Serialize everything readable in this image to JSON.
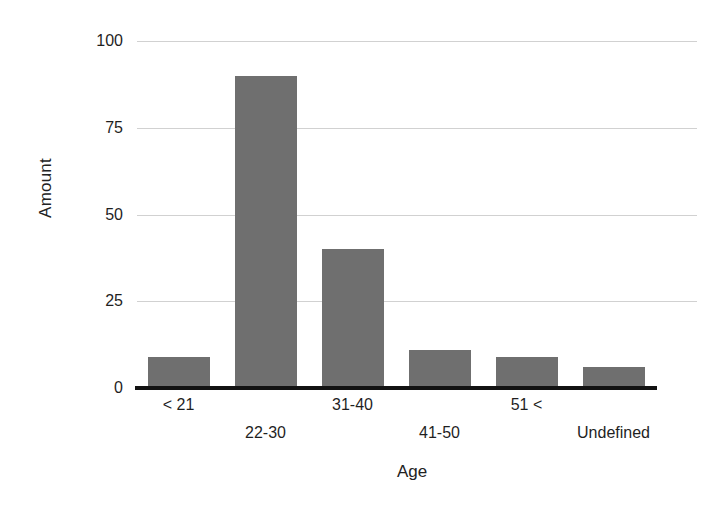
{
  "chart_data": {
    "type": "bar",
    "title": "",
    "subtitle": "",
    "xlabel": "Age",
    "ylabel": "Amount",
    "categories": [
      "< 21",
      "22-30",
      "31-40",
      "41-50",
      "51 <",
      "Undefined"
    ],
    "values": [
      9,
      90,
      40,
      11,
      9,
      6
    ],
    "series": [
      {
        "name": "Amount",
        "values": [
          9,
          90,
          40,
          11,
          9,
          6
        ]
      }
    ],
    "ylim": [
      0,
      100
    ],
    "y_ticks": [
      0,
      25,
      50,
      75,
      100
    ],
    "y_tick_labels": [
      "0",
      "25",
      "50",
      "75",
      "100"
    ],
    "grid": true,
    "grid_axis": "y",
    "legend": false,
    "legend_position": "none",
    "bar_color": "#6f6f6f",
    "gridline_color": "#c9c9c9",
    "axis_color": "#121212",
    "background_color": "#ffffff",
    "x_label_layout": "staggered-two-rows",
    "annotations": []
  },
  "axes": {
    "y_title": "Amount",
    "x_title": "Age"
  }
}
